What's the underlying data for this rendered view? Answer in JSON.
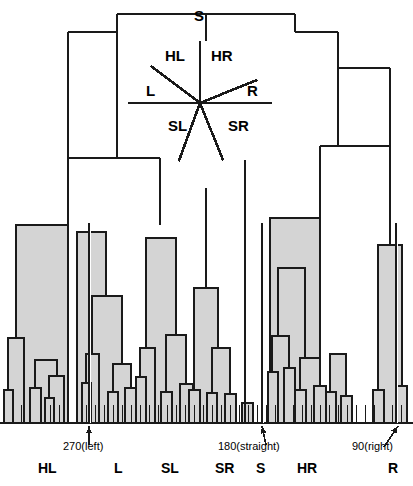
{
  "figure": {
    "type": "dendrogram-with-compass-overlay",
    "background_color": "#ffffff",
    "line_color": "#1a1a1a",
    "fill_color": "#d4d4d4"
  },
  "compass": {
    "center": [
      200,
      103
    ],
    "labels": {
      "s": "S",
      "hl": "HL",
      "hr": "HR",
      "l": "L",
      "r": "R",
      "sl": "SL",
      "sr": "SR"
    },
    "rays": [
      {
        "name": "s-ray",
        "angle_deg": 90,
        "length": 62
      },
      {
        "name": "hl-ray",
        "angle_deg": 143,
        "length": 62
      },
      {
        "name": "hr-ray",
        "angle_deg": 22,
        "length": 62
      },
      {
        "name": "l-ray",
        "angle_deg": 180,
        "length": 72
      },
      {
        "name": "r-ray",
        "angle_deg": 0,
        "length": 72
      },
      {
        "name": "sl-ray",
        "angle_deg": 250,
        "length": 62
      },
      {
        "name": "sr-ray",
        "angle_deg": 292,
        "length": 62
      }
    ]
  },
  "annotations": [
    {
      "name": "annotation-270-left",
      "text": "270(left)",
      "x": 63,
      "y": 447
    },
    {
      "name": "annotation-180-straight",
      "text": "180(straight)",
      "x": 218,
      "y": 447
    },
    {
      "name": "annotation-90-right",
      "text": "90(right)",
      "x": 354,
      "y": 447
    }
  ],
  "bottom_labels": [
    {
      "name": "bottom-label-hl",
      "text": "HL",
      "x": 38
    },
    {
      "name": "bottom-label-l",
      "text": "L",
      "x": 114
    },
    {
      "name": "bottom-label-sl",
      "text": "SL",
      "x": 161
    },
    {
      "name": "bottom-label-sr",
      "text": "SR",
      "x": 217
    },
    {
      "name": "bottom-label-s",
      "text": "S",
      "x": 258
    },
    {
      "name": "bottom-label-hr",
      "text": "HR",
      "x": 299
    },
    {
      "name": "bottom-label-r",
      "text": "R",
      "x": 390
    }
  ],
  "chart_data": {
    "type": "dendrogram",
    "title": "",
    "xlabel": "",
    "ylabel": "",
    "baseline_y": 423,
    "categories": [
      "HL",
      "L",
      "SL",
      "SR",
      "S",
      "HR",
      "R"
    ],
    "marked_angles": [
      {
        "label": "270(left)",
        "leaf_x": 89
      },
      {
        "label": "180(straight)",
        "leaf_x": 262
      },
      {
        "label": "90(right)",
        "leaf_x": 396
      }
    ],
    "cluster_breaks_x": [
      89,
      262,
      396
    ],
    "links": [
      {
        "x1": 117,
        "x2": 295,
        "y": 14,
        "name": "root"
      },
      {
        "x1": 68,
        "x2": 117,
        "y": 32,
        "name": "link-l1"
      },
      {
        "x1": 295,
        "x2": 338,
        "y": 32,
        "name": "link-r1"
      },
      {
        "x1": 68,
        "x2": 160,
        "y": 158,
        "name": "link-l2"
      },
      {
        "x1": 338,
        "x2": 390,
        "y": 68,
        "name": "link-r2"
      },
      {
        "x1": 320,
        "x2": 390,
        "y": 146,
        "name": "link-r3"
      }
    ],
    "stems": [
      {
        "x": 206,
        "y1": 14,
        "y2": 41,
        "name": "stem-root"
      },
      {
        "x": 117,
        "y1": 14,
        "y2": 32,
        "name": "stem-l1"
      },
      {
        "x": 295,
        "y1": 14,
        "y2": 32,
        "name": "stem-r1"
      },
      {
        "x": 338,
        "y1": 32,
        "y2": 68,
        "name": "stem-r2"
      },
      {
        "x": 68,
        "y1": 32,
        "y2": 158,
        "name": "stem-l2"
      },
      {
        "x": 390,
        "y1": 68,
        "y2": 146,
        "name": "stem-r3"
      },
      {
        "x": 160,
        "y1": 158,
        "y2": 225,
        "name": "stem-sl"
      },
      {
        "x": 206,
        "y1": 188,
        "y2": 288,
        "name": "stem-sr"
      },
      {
        "x": 245,
        "y1": 160,
        "y2": 423,
        "name": "stem-s"
      },
      {
        "x": 320,
        "y1": 146,
        "y2": 218,
        "name": "stem-hr"
      }
    ],
    "boxes": [
      {
        "name": "box-hl-main",
        "x1": 16,
        "x2": 68,
        "y_top": 225,
        "depth": 198
      },
      {
        "name": "box-hl-a",
        "x1": 8,
        "x2": 24,
        "y_top": 338,
        "depth": 85
      },
      {
        "name": "box-hl-a1",
        "x1": 4,
        "x2": 13,
        "y_top": 390,
        "depth": 33
      },
      {
        "name": "box-hl-b",
        "x1": 35,
        "x2": 57,
        "y_top": 360,
        "depth": 63
      },
      {
        "name": "box-hl-b1",
        "x1": 30,
        "x2": 41,
        "y_top": 388,
        "depth": 35
      },
      {
        "name": "box-hl-b2",
        "x1": 49,
        "x2": 64,
        "y_top": 376,
        "depth": 47
      },
      {
        "name": "box-hl-b2a",
        "x1": 45,
        "x2": 54,
        "y_top": 398,
        "depth": 25
      },
      {
        "name": "box-l-main",
        "x1": 77,
        "x2": 106,
        "y_top": 232,
        "depth": 191
      },
      {
        "name": "box-l-sub",
        "x1": 92,
        "x2": 122,
        "y_top": 296,
        "depth": 127
      },
      {
        "name": "box-l-a",
        "x1": 86,
        "x2": 99,
        "y_top": 354,
        "depth": 69
      },
      {
        "name": "box-l-a1",
        "x1": 82,
        "x2": 91,
        "y_top": 383,
        "depth": 40
      },
      {
        "name": "box-l-b",
        "x1": 113,
        "x2": 131,
        "y_top": 364,
        "depth": 59
      },
      {
        "name": "box-l-b1",
        "x1": 108,
        "x2": 118,
        "y_top": 392,
        "depth": 31
      },
      {
        "name": "box-l-b2",
        "x1": 125,
        "x2": 139,
        "y_top": 388,
        "depth": 35
      },
      {
        "name": "box-sl-main",
        "x1": 146,
        "x2": 176,
        "y_top": 238,
        "depth": 185
      },
      {
        "name": "box-sl-a",
        "x1": 140,
        "x2": 155,
        "y_top": 348,
        "depth": 75
      },
      {
        "name": "box-sl-a1",
        "x1": 136,
        "x2": 146,
        "y_top": 377,
        "depth": 46
      },
      {
        "name": "box-sl-b",
        "x1": 166,
        "x2": 186,
        "y_top": 335,
        "depth": 88
      },
      {
        "name": "box-sl-b1",
        "x1": 161,
        "x2": 172,
        "y_top": 392,
        "depth": 31
      },
      {
        "name": "box-sl-b2",
        "x1": 180,
        "x2": 193,
        "y_top": 384,
        "depth": 39
      },
      {
        "name": "box-sl-c",
        "x1": 196,
        "x2": 207,
        "y_top": 400,
        "depth": 23
      },
      {
        "name": "box-sr-main",
        "x1": 194,
        "x2": 218,
        "y_top": 288,
        "depth": 135
      },
      {
        "name": "box-sr-a",
        "x1": 189,
        "x2": 200,
        "y_top": 390,
        "depth": 33
      },
      {
        "name": "box-sr-b",
        "x1": 212,
        "x2": 230,
        "y_top": 348,
        "depth": 75
      },
      {
        "name": "box-sr-b1",
        "x1": 207,
        "x2": 217,
        "y_top": 393,
        "depth": 30
      },
      {
        "name": "box-sr-b2",
        "x1": 225,
        "x2": 236,
        "y_top": 394,
        "depth": 29
      },
      {
        "name": "box-sr-c",
        "x1": 242,
        "x2": 253,
        "y_top": 403,
        "depth": 20
      },
      {
        "name": "box-hr-main",
        "x1": 270,
        "x2": 320,
        "y_top": 218,
        "depth": 205
      },
      {
        "name": "box-hr-sub",
        "x1": 278,
        "x2": 305,
        "y_top": 268,
        "depth": 155
      },
      {
        "name": "box-hr-a",
        "x1": 272,
        "x2": 289,
        "y_top": 336,
        "depth": 87
      },
      {
        "name": "box-hr-a1",
        "x1": 268,
        "x2": 278,
        "y_top": 372,
        "depth": 51
      },
      {
        "name": "box-hr-a2",
        "x1": 284,
        "x2": 295,
        "y_top": 368,
        "depth": 55
      },
      {
        "name": "box-hr-b",
        "x1": 300,
        "x2": 320,
        "y_top": 358,
        "depth": 65
      },
      {
        "name": "box-hr-b1",
        "x1": 295,
        "x2": 306,
        "y_top": 390,
        "depth": 33
      },
      {
        "name": "box-hr-b2",
        "x1": 314,
        "x2": 326,
        "y_top": 386,
        "depth": 37
      },
      {
        "name": "box-hr-c",
        "x1": 330,
        "x2": 346,
        "y_top": 354,
        "depth": 69
      },
      {
        "name": "box-hr-c1",
        "x1": 326,
        "x2": 336,
        "y_top": 392,
        "depth": 31
      },
      {
        "name": "box-hr-c2",
        "x1": 341,
        "x2": 352,
        "y_top": 396,
        "depth": 27
      },
      {
        "name": "box-r-main",
        "x1": 378,
        "x2": 402,
        "y_top": 245,
        "depth": 178
      },
      {
        "name": "box-r-a",
        "x1": 373,
        "x2": 384,
        "y_top": 390,
        "depth": 33
      },
      {
        "name": "box-r-b",
        "x1": 396,
        "x2": 407,
        "y_top": 386,
        "depth": 37
      }
    ],
    "leaf_ticks_x": [
      4,
      13,
      21,
      30,
      41,
      50,
      59,
      68,
      77,
      86,
      95,
      104,
      113,
      122,
      131,
      140,
      149,
      158,
      167,
      176,
      185,
      194,
      203,
      212,
      221,
      230,
      239,
      248,
      257,
      266,
      275,
      284,
      293,
      302,
      311,
      320,
      329,
      338,
      347,
      356,
      365,
      374,
      383,
      392,
      401
    ],
    "grid": false,
    "legend": null
  }
}
